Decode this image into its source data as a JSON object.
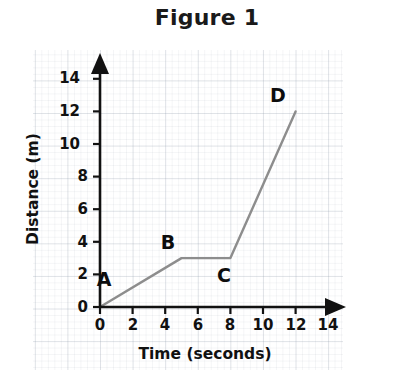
{
  "title": "Figure 1",
  "chart_data": {
    "type": "line",
    "title": "Figure 1",
    "xlabel": "Time (seconds)",
    "ylabel": "Distance (m)",
    "xlim": [
      0,
      14
    ],
    "ylim": [
      0,
      14
    ],
    "x_ticks": [
      "0",
      "2",
      "4",
      "6",
      "8",
      "10",
      "12",
      "14"
    ],
    "y_ticks": [
      "0",
      "2",
      "4",
      "6",
      "8",
      "10",
      "12",
      "14"
    ],
    "x_tick_values": [
      0,
      2,
      4,
      6,
      8,
      10,
      12,
      14
    ],
    "y_tick_values": [
      0,
      2,
      4,
      6,
      8,
      10,
      12,
      14
    ],
    "grid": true,
    "grid_style": "graph-paper",
    "legend": "none",
    "series": [
      {
        "name": "distance",
        "color": "#8d8d8d",
        "x": [
          0,
          5,
          8,
          12
        ],
        "y": [
          0,
          3,
          3,
          12
        ],
        "points": [
          {
            "label": "A",
            "x": 0,
            "y": 0
          },
          {
            "label": "B",
            "x": 5,
            "y": 3
          },
          {
            "label": "C",
            "x": 8,
            "y": 3
          },
          {
            "label": "D",
            "x": 12,
            "y": 12
          }
        ]
      }
    ],
    "annotations": [
      {
        "text": "A",
        "x": 0,
        "y": 0,
        "placement": "above-right"
      },
      {
        "text": "B",
        "x": 5,
        "y": 3,
        "placement": "above-left"
      },
      {
        "text": "C",
        "x": 8,
        "y": 3,
        "placement": "below-right"
      },
      {
        "text": "D",
        "x": 12,
        "y": 12,
        "placement": "above-right"
      }
    ]
  },
  "axis": {
    "x_title": "Time (seconds)",
    "y_title": "Distance (m)",
    "axis_color": "#111111",
    "x_tick_labels": [
      "0",
      "2",
      "4",
      "6",
      "8",
      "10",
      "12",
      "14"
    ],
    "y_tick_labels": [
      "0",
      "2",
      "4",
      "6",
      "8",
      "10",
      "12",
      "14"
    ]
  },
  "colors": {
    "line": "#8d8d8d",
    "axis": "#111111",
    "text": "#111111",
    "grid_major": "rgba(150,160,175,0.22)",
    "grid_minor": "rgba(150,160,175,0.10)",
    "background": "#ffffff"
  },
  "point_labels": [
    "A",
    "B",
    "C",
    "D"
  ]
}
